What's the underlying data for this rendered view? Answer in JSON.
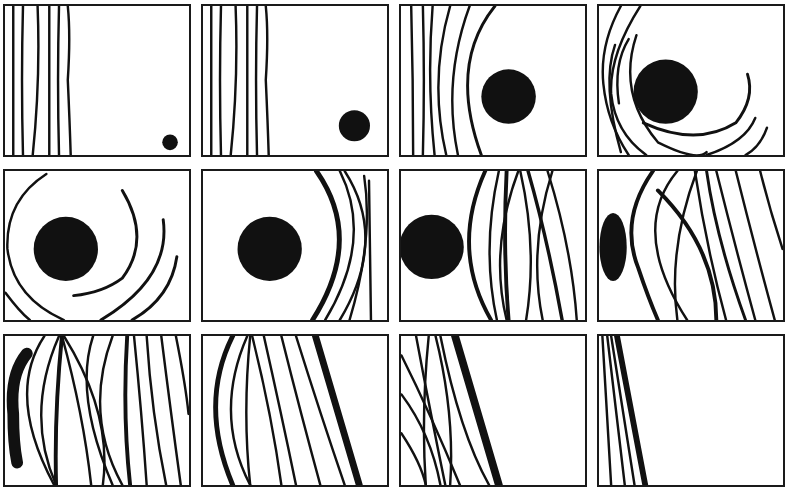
{
  "figure": {
    "layout": {
      "rows": 3,
      "columns": 4
    },
    "colors": {
      "ink": "#111111",
      "background": "#ffffff",
      "border": "#1a1a1a"
    },
    "panels": [
      {
        "index": 1,
        "row": 1,
        "col": 1,
        "content": "vertical-lines-left, small-dot-bottom-right"
      },
      {
        "index": 2,
        "row": 1,
        "col": 2,
        "content": "vertical-lines-left, medium-dot-bottom-right"
      },
      {
        "index": 3,
        "row": 1,
        "col": 3,
        "content": "curving-lines-left, large-disk-center-right"
      },
      {
        "index": 4,
        "row": 1,
        "col": 4,
        "content": "lines-wrapping-around-disk, disk-upper-center"
      },
      {
        "index": 5,
        "row": 2,
        "col": 1,
        "content": "spiral-arcs-around-disk, disk-left"
      },
      {
        "index": 6,
        "row": 2,
        "col": 2,
        "content": "disk-center-left, arcs-on-right"
      },
      {
        "index": 7,
        "row": 2,
        "col": 3,
        "content": "disk-at-left-edge, dense-lines-right"
      },
      {
        "index": 8,
        "row": 2,
        "col": 4,
        "content": "half-disk-at-left-edge, dense-diagonal-lines"
      },
      {
        "index": 9,
        "row": 3,
        "col": 1,
        "content": "sliver-of-disk-left, very-dense-crossing-lines"
      },
      {
        "index": 10,
        "row": 3,
        "col": 2,
        "content": "curved-lines-left, thick-diagonal-band"
      },
      {
        "index": 11,
        "row": 3,
        "col": 3,
        "content": "crossing-lines-left-third, thick-diagonal-band"
      },
      {
        "index": 12,
        "row": 3,
        "col": 4,
        "content": "few-diagonal-lines-at-left-edge"
      }
    ]
  }
}
